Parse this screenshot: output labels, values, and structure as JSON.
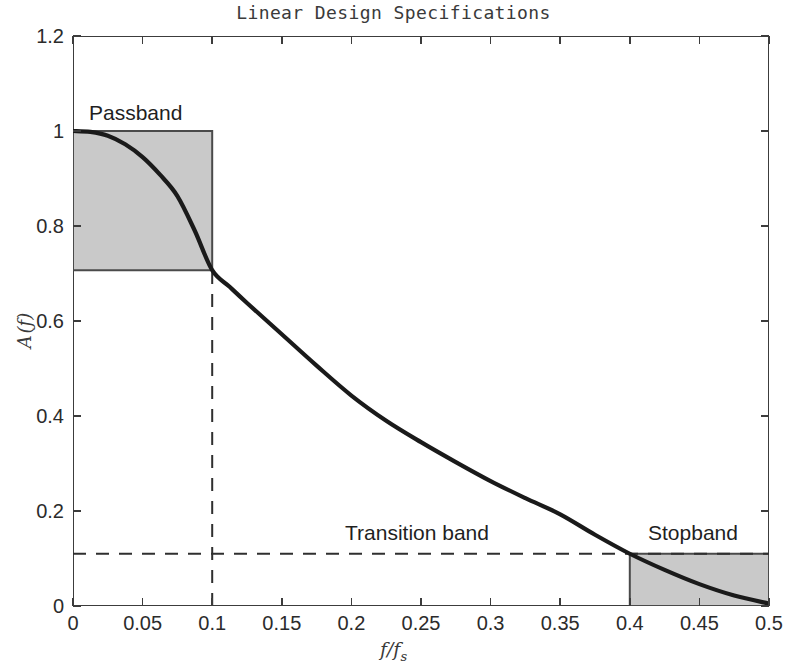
{
  "chart_data": {
    "type": "line",
    "title": "Linear Design Specifications",
    "xlabel": "f/fs",
    "ylabel": "A(f)",
    "xlim": [
      0,
      0.5
    ],
    "ylim": [
      0,
      1.2
    ],
    "grid": false,
    "legend": "none",
    "xticks": [
      "0",
      "0.05",
      "0.1",
      "0.15",
      "0.2",
      "0.25",
      "0.3",
      "0.35",
      "0.4",
      "0.45",
      "0.5"
    ],
    "xtick_values": [
      0,
      0.05,
      0.1,
      0.15,
      0.2,
      0.25,
      0.3,
      0.35,
      0.4,
      0.45,
      0.5
    ],
    "yticks": [
      "0",
      "0.2",
      "0.4",
      "0.6",
      "0.8",
      "1",
      "1.2"
    ],
    "ytick_values": [
      0,
      0.2,
      0.4,
      0.6,
      0.8,
      1,
      1.2
    ],
    "series": [
      {
        "name": "magnitude-response",
        "color": "#1a1a1a",
        "x": [
          0,
          0.0125,
          0.025,
          0.0375,
          0.05,
          0.0625,
          0.075,
          0.0875,
          0.1,
          0.1125,
          0.125,
          0.15,
          0.175,
          0.2,
          0.225,
          0.25,
          0.275,
          0.3,
          0.325,
          0.35,
          0.375,
          0.4,
          0.425,
          0.45,
          0.475,
          0.5
        ],
        "y": [
          1.0,
          0.998,
          0.99,
          0.972,
          0.945,
          0.908,
          0.863,
          0.79,
          0.707,
          0.672,
          0.638,
          0.572,
          0.506,
          0.443,
          0.39,
          0.345,
          0.303,
          0.263,
          0.227,
          0.193,
          0.15,
          0.11,
          0.076,
          0.046,
          0.022,
          0.005
        ]
      }
    ],
    "regions": [
      {
        "name": "passband",
        "label": "Passband",
        "x_range": [
          0,
          0.1
        ],
        "y_range": [
          0.707,
          1.0
        ],
        "fill": "#c9c9c9",
        "edge": "#4a4a4a"
      },
      {
        "name": "stopband",
        "label": "Stopband",
        "x_range": [
          0.4,
          0.5
        ],
        "y_range": [
          0,
          0.11
        ],
        "fill": "#c9c9c9",
        "edge": "#4a4a4a"
      }
    ],
    "annotations": [
      {
        "name": "passband-label",
        "text": "Passband"
      },
      {
        "name": "transition-band-label",
        "text": "Transition band"
      },
      {
        "name": "stopband-label",
        "text": "Stopband"
      }
    ],
    "guides": [
      {
        "name": "stopband-level-line",
        "orientation": "horizontal",
        "value": 0.11,
        "style": "dashed"
      },
      {
        "name": "passband-edge-line",
        "orientation": "vertical",
        "value": 0.1,
        "style": "dashed",
        "from": 0,
        "to": 0.707
      }
    ]
  }
}
